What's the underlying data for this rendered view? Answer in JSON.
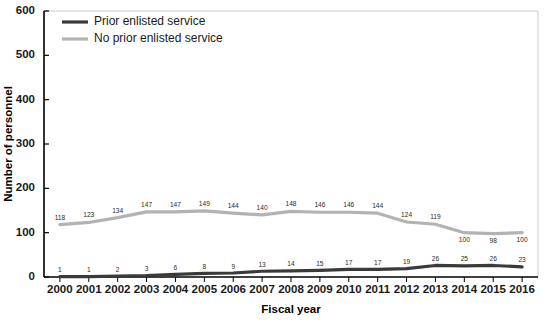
{
  "chart_data": {
    "type": "line",
    "title": "",
    "xlabel": "Fiscal year",
    "ylabel": "Number of personnel",
    "categories": [
      "2000",
      "2001",
      "2002",
      "2003",
      "2004",
      "2005",
      "2006",
      "2007",
      "2008",
      "2009",
      "2010",
      "2011",
      "2012",
      "2013",
      "2014",
      "2015",
      "2016"
    ],
    "ylim": [
      0,
      600
    ],
    "yticks": [
      0,
      100,
      200,
      300,
      400,
      500,
      600
    ],
    "grid": false,
    "legend_position": "top-left",
    "series": [
      {
        "name": "Prior enlisted service",
        "color": "#3a3a3a",
        "values": [
          1,
          1,
          2,
          3,
          6,
          8,
          9,
          13,
          14,
          15,
          17,
          17,
          19,
          26,
          25,
          26,
          23
        ],
        "labels": [
          "1",
          "1",
          "2",
          "3",
          "6",
          "8",
          "9",
          "13",
          "14",
          "15",
          "17",
          "17",
          "19",
          "26",
          "25",
          "26",
          "23"
        ]
      },
      {
        "name": "No prior enlisted service",
        "color": "#b3b3b3",
        "values": [
          118,
          123,
          134,
          147,
          147,
          149,
          144,
          140,
          148,
          146,
          146,
          144,
          124,
          119,
          100,
          98,
          100
        ],
        "labels": [
          "118",
          "123",
          "134",
          "147",
          "147",
          "149",
          "144",
          "140",
          "148",
          "146",
          "146",
          "144",
          "124",
          "119",
          "100",
          "98",
          "100"
        ]
      }
    ]
  },
  "legend": {
    "items": [
      {
        "label": "Prior enlisted service",
        "color": "#3a3a3a"
      },
      {
        "label": "No prior enlisted service",
        "color": "#b3b3b3"
      }
    ]
  },
  "axes": {
    "y_title": "Number of personnel",
    "x_title": "Fiscal year",
    "y_tick_labels": [
      "0",
      "100",
      "200",
      "300",
      "400",
      "500",
      "600"
    ],
    "x_tick_labels": [
      "2000",
      "2001",
      "2002",
      "2003",
      "2004",
      "2005",
      "2006",
      "2007",
      "2008",
      "2009",
      "2010",
      "2011",
      "2012",
      "2013",
      "2014",
      "2015",
      "2016"
    ]
  }
}
